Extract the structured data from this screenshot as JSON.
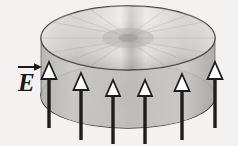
{
  "figure": {
    "name": "electric-field-between-parallel-disks",
    "background_color": "#f4f2f0",
    "width": 238,
    "height": 146,
    "label": {
      "text": "E",
      "accent": "vector-arrow",
      "meaning": "electric field vector",
      "x": 18,
      "y": 64,
      "font_size": 26,
      "color": "#1a1a1a"
    },
    "disks": [
      {
        "name": "top-disk",
        "cx": 128,
        "cy": 38,
        "rx": 87,
        "ry": 32,
        "fill_light": "#e8e6e4",
        "fill_mid": "#c9c7c6",
        "fill_dark": "#a9a7a6",
        "stroke": "#3a3a3a",
        "stroke_width": 1.4,
        "texture": "radial-brushed-conic"
      },
      {
        "name": "bottom-disk",
        "cx": 128,
        "cy": 96,
        "rx": 87,
        "ry": 32,
        "fill_light": "#d6d4d2",
        "fill_mid": "#b5b3b2",
        "fill_dark": "#8e8c8b",
        "stroke": "#3a3a3a",
        "stroke_width": 1.4,
        "texture": "radial-brushed-conic"
      }
    ],
    "side_wall": {
      "name": "cylinder-side-wall",
      "fill": "#c2c0be",
      "stroke": "#3a3a3a"
    },
    "arrows": {
      "count": 6,
      "direction": "up",
      "head_fill": "#ffffff",
      "head_stroke": "#1d1d1d",
      "stem_color": "#1d1d1d",
      "stem_width": 3.4,
      "head_width": 15,
      "head_height": 17,
      "items": [
        {
          "name": "field-arrow-1",
          "x": 49,
          "tip_y": 62,
          "base_y": 128
        },
        {
          "name": "field-arrow-2",
          "x": 81,
          "tip_y": 73,
          "base_y": 140
        },
        {
          "name": "field-arrow-3",
          "x": 113,
          "tip_y": 80,
          "base_y": 144
        },
        {
          "name": "field-arrow-4",
          "x": 145,
          "tip_y": 80,
          "base_y": 144
        },
        {
          "name": "field-arrow-5",
          "x": 182,
          "tip_y": 74,
          "base_y": 140
        },
        {
          "name": "field-arrow-6",
          "x": 215,
          "tip_y": 62,
          "base_y": 128
        }
      ]
    }
  }
}
